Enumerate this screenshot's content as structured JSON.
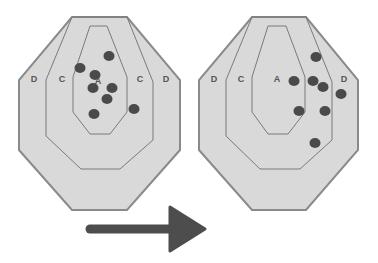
{
  "diagram": {
    "colors": {
      "target_fill": "#d9d9d9",
      "target_stroke": "#8a8a8a",
      "zone_stroke": "#7a7a7a",
      "shot": "#4a4a4a",
      "arrow": "#4d4d4d",
      "label": "#555555",
      "background": "#ffffff"
    },
    "targets": [
      {
        "id": "before",
        "labels": [
          {
            "text": "D",
            "x": 34,
            "y": 82
          },
          {
            "text": "C",
            "x": 62,
            "y": 82
          },
          {
            "text": "A",
            "x": 98,
            "y": 84
          },
          {
            "text": "C",
            "x": 140,
            "y": 82
          },
          {
            "text": "D",
            "x": 166,
            "y": 82
          }
        ],
        "shots": [
          {
            "x": 109,
            "y": 56
          },
          {
            "x": 80,
            "y": 68
          },
          {
            "x": 95,
            "y": 75
          },
          {
            "x": 93,
            "y": 88
          },
          {
            "x": 112,
            "y": 88
          },
          {
            "x": 107,
            "y": 99
          },
          {
            "x": 134,
            "y": 109
          },
          {
            "x": 94,
            "y": 114
          }
        ]
      },
      {
        "id": "after",
        "labels": [
          {
            "text": "D",
            "x": 214,
            "y": 82
          },
          {
            "text": "C",
            "x": 241,
            "y": 82
          },
          {
            "text": "A",
            "x": 277,
            "y": 82
          },
          {
            "text": "D",
            "x": 344,
            "y": 82
          }
        ],
        "shots": [
          {
            "x": 316,
            "y": 57
          },
          {
            "x": 294,
            "y": 81
          },
          {
            "x": 313,
            "y": 81
          },
          {
            "x": 323,
            "y": 87
          },
          {
            "x": 341,
            "y": 94
          },
          {
            "x": 299,
            "y": 111
          },
          {
            "x": 325,
            "y": 111
          },
          {
            "x": 315,
            "y": 143
          }
        ]
      }
    ],
    "arrow": {
      "direction": "right",
      "from_x": 87,
      "to_x": 205,
      "y": 229
    }
  }
}
